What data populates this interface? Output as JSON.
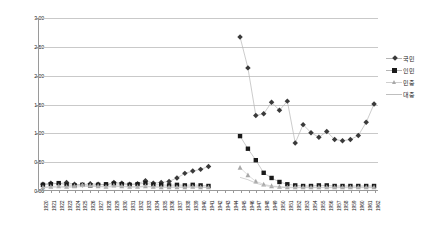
{
  "chart_data": {
    "type": "line",
    "title": "",
    "subtitle": "",
    "xlabel": "",
    "ylabel": "",
    "ylim": [
      0.0,
      3.0
    ],
    "ytick_values": [
      0.0,
      0.5,
      1.0,
      1.5,
      2.0,
      2.5,
      3.0
    ],
    "ytick_labels": [
      "0.00",
      "0.50",
      "1.00",
      "1.50",
      "2.00",
      "2.50",
      "3.00"
    ],
    "grid": true,
    "legend_position": "right",
    "x": [
      1920,
      1921,
      1922,
      1923,
      1924,
      1925,
      1926,
      1927,
      1928,
      1929,
      1930,
      1931,
      1932,
      1933,
      1934,
      1935,
      1936,
      1937,
      1938,
      1939,
      1940,
      1941,
      1942,
      1943,
      1944,
      1945,
      1946,
      1947,
      1948,
      1949,
      1950,
      1951,
      1952,
      1953,
      1954,
      1955,
      1956,
      1957,
      1958,
      1959,
      1960,
      1961,
      1962
    ],
    "categories": [
      "1920",
      "1921",
      "1922",
      "1923",
      "1924",
      "1925",
      "1926",
      "1927",
      "1928",
      "1929",
      "1930",
      "1931",
      "1932",
      "1933",
      "1934",
      "1935",
      "1936",
      "1937",
      "1938",
      "1939",
      "1940",
      "1941",
      "1942",
      "1943",
      "1944",
      "1945",
      "1946",
      "1947",
      "1948",
      "1949",
      "1950",
      "1951",
      "1952",
      "1953",
      "1954",
      "1955",
      "1956",
      "1957",
      "1958",
      "1959",
      "1960",
      "1961",
      "1962"
    ],
    "series": [
      {
        "name": "국민",
        "marker": "diamond",
        "color": "#3a3a3a",
        "line_color": "#b5b5b5",
        "values": [
          0.1,
          0.12,
          0.11,
          0.13,
          0.1,
          0.09,
          0.11,
          0.1,
          0.09,
          0.13,
          0.12,
          0.1,
          0.11,
          0.16,
          0.12,
          0.13,
          0.15,
          0.21,
          0.29,
          0.33,
          0.36,
          0.41,
          null,
          null,
          null,
          2.67,
          2.13,
          1.3,
          1.33,
          1.53,
          1.39,
          1.55,
          0.82,
          1.14,
          1.0,
          0.92,
          1.02,
          0.88,
          0.86,
          0.88,
          0.95,
          1.18,
          1.5
        ]
      },
      {
        "name": "인민",
        "marker": "square",
        "color": "#1a1a1a",
        "line_color": "#b5b5b5",
        "values": [
          0.09,
          0.1,
          0.12,
          0.09,
          0.08,
          0.09,
          0.08,
          0.09,
          0.1,
          0.11,
          0.1,
          0.09,
          0.1,
          0.12,
          0.09,
          0.09,
          0.08,
          0.09,
          0.08,
          0.09,
          0.08,
          0.07,
          null,
          null,
          null,
          0.94,
          0.72,
          0.52,
          0.3,
          0.21,
          0.14,
          0.1,
          0.08,
          0.07,
          0.07,
          0.08,
          0.08,
          0.07,
          0.07,
          0.07,
          0.07,
          0.07,
          0.07
        ]
      },
      {
        "name": "민중",
        "marker": "triangle",
        "color": "#a8a8a8",
        "line_color": "#cfcfcf",
        "values": [
          0.05,
          0.06,
          0.07,
          0.06,
          0.07,
          0.09,
          0.08,
          0.07,
          0.06,
          0.08,
          0.07,
          0.06,
          0.06,
          0.07,
          0.06,
          0.05,
          0.05,
          0.05,
          0.05,
          0.06,
          0.05,
          0.05,
          null,
          null,
          null,
          0.39,
          0.26,
          0.15,
          0.1,
          0.07,
          0.06,
          0.05,
          0.05,
          0.05,
          0.05,
          0.05,
          0.05,
          0.05,
          0.05,
          0.05,
          0.05,
          0.05,
          0.05
        ]
      },
      {
        "name": "대중",
        "marker": "line",
        "color": "#bfbfbf",
        "line_color": "#bfbfbf",
        "values": [
          0.04,
          0.05,
          0.05,
          0.05,
          0.05,
          0.06,
          0.06,
          0.06,
          0.05,
          0.06,
          0.06,
          0.05,
          0.05,
          0.06,
          0.05,
          0.05,
          0.05,
          0.05,
          0.05,
          0.05,
          0.05,
          0.04,
          null,
          null,
          null,
          0.22,
          0.18,
          0.12,
          0.08,
          0.06,
          0.05,
          0.04,
          0.04,
          0.04,
          0.04,
          0.04,
          0.04,
          0.04,
          0.04,
          0.04,
          0.04,
          0.04,
          0.04
        ]
      }
    ]
  },
  "legend": {
    "items": [
      {
        "label": "국민"
      },
      {
        "label": "인민"
      },
      {
        "label": "민중"
      },
      {
        "label": "대중"
      }
    ]
  },
  "colors": {
    "grid": "#c9c9c9",
    "axis": "#9a9a9a",
    "background": "#ffffff"
  }
}
